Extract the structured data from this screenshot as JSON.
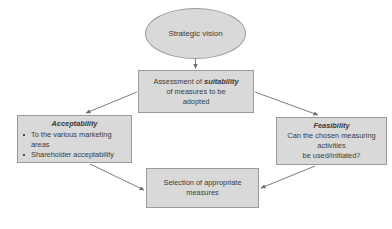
{
  "diagram": {
    "node_fill": "#d9d9d9",
    "node_stroke": "#9a9a9a",
    "arrow_color": "#6e6e6e",
    "background": "#ffffff",
    "nodes": {
      "vision": {
        "shape": "ellipse",
        "label": "Strategic vision"
      },
      "assessment": {
        "shape": "rectangle",
        "line1_prefix": "Assessment of ",
        "line1_emphasis": "suitability",
        "line2": "of measures to be",
        "line3": "adopted"
      },
      "acceptability": {
        "shape": "rectangle",
        "title": "Acceptability",
        "bullets": [
          "To the various marketing areas",
          "Shareholder acceptability"
        ]
      },
      "feasibility": {
        "shape": "rectangle",
        "title": "Feasibility",
        "line1": "Can the chosen measuring",
        "line2": "activities",
        "line3": "be used/initiated?"
      },
      "selection": {
        "shape": "rectangle",
        "line1": "Selection of appropriate",
        "line2": "measures"
      }
    },
    "arrows": [
      {
        "from": "vision",
        "to": "assessment",
        "direction": "down"
      },
      {
        "from": "assessment",
        "to": "acceptability",
        "direction": "down-left"
      },
      {
        "from": "assessment",
        "to": "feasibility",
        "direction": "down-right"
      },
      {
        "from": "acceptability",
        "to": "selection",
        "direction": "down-right"
      },
      {
        "from": "feasibility",
        "to": "selection",
        "direction": "down-left"
      }
    ]
  }
}
